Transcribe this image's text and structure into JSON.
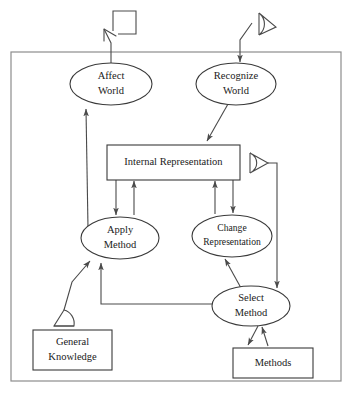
{
  "diagram": {
    "frame": {
      "label": "agent-boundary",
      "x": 11,
      "y": 52,
      "width": 330,
      "height": 329
    },
    "nodes": [
      {
        "id": "affect-world",
        "shape": "ellipse",
        "lines": [
          "Affect",
          "World"
        ],
        "cx": 111,
        "cy": 84,
        "rx": 41,
        "ry": 21
      },
      {
        "id": "recognize-world",
        "shape": "ellipse",
        "lines": [
          "Recognize",
          "World"
        ],
        "cx": 236,
        "cy": 84,
        "rx": 40,
        "ry": 21
      },
      {
        "id": "internal-representation",
        "shape": "rect",
        "lines": [
          "Internal Representation"
        ],
        "x": 107,
        "y": 145,
        "width": 133,
        "height": 35
      },
      {
        "id": "apply-method",
        "shape": "ellipse",
        "lines": [
          "Apply",
          "Method"
        ],
        "cx": 120,
        "cy": 238,
        "rx": 39,
        "ry": 21
      },
      {
        "id": "change-representation",
        "shape": "ellipse",
        "lines": [
          "Change",
          "Representation"
        ],
        "cx": 232,
        "cy": 236,
        "rx": 40,
        "ry": 21
      },
      {
        "id": "select-method",
        "shape": "ellipse",
        "lines": [
          "Select",
          "Method"
        ],
        "cx": 251,
        "cy": 306,
        "rx": 39,
        "ry": 20
      },
      {
        "id": "general-knowledge",
        "shape": "rect",
        "lines": [
          "General",
          "Knowledge"
        ],
        "x": 33,
        "y": 330,
        "width": 79,
        "height": 40
      },
      {
        "id": "methods",
        "shape": "rect",
        "lines": [
          "Methods"
        ],
        "x": 233,
        "y": 348,
        "width": 80,
        "height": 30
      }
    ],
    "sensors": [
      {
        "id": "effector-bracket",
        "kind": "bracket",
        "description": "open square bracket effector symbol"
      },
      {
        "id": "world-sensor-eye",
        "kind": "eye",
        "description": "lens sensor symbol observing the world"
      },
      {
        "id": "representation-sensor-eye",
        "kind": "eye",
        "description": "lens sensor reading internal representation"
      },
      {
        "id": "knowledge-sensor-eye",
        "kind": "eye",
        "description": "lens sensor reading general knowledge"
      }
    ],
    "edges": [
      {
        "id": "affect-world-to-effector",
        "from": "affect-world",
        "to": "effector-bracket"
      },
      {
        "id": "world-sensor-to-recognize-world",
        "from": "world-sensor-eye",
        "to": "recognize-world"
      },
      {
        "id": "recognize-world-to-internal-representation",
        "from": "recognize-world",
        "to": "internal-representation"
      },
      {
        "id": "internal-representation-to-apply-method",
        "from": "internal-representation",
        "to": "apply-method"
      },
      {
        "id": "apply-method-to-internal-representation",
        "from": "apply-method",
        "to": "internal-representation"
      },
      {
        "id": "internal-representation-to-change-representation",
        "from": "internal-representation",
        "to": "change-representation"
      },
      {
        "id": "change-representation-to-internal-representation",
        "from": "change-representation",
        "to": "internal-representation"
      },
      {
        "id": "apply-method-to-affect-world",
        "from": "apply-method",
        "to": "affect-world"
      },
      {
        "id": "representation-sensor-to-select-method",
        "from": "representation-sensor-eye",
        "to": "select-method"
      },
      {
        "id": "select-method-to-change-representation",
        "from": "select-method",
        "to": "change-representation"
      },
      {
        "id": "select-method-to-apply-method",
        "from": "select-method",
        "to": "apply-method"
      },
      {
        "id": "knowledge-sensor-to-apply-method",
        "from": "knowledge-sensor-eye",
        "to": "apply-method"
      },
      {
        "id": "select-method-to-methods",
        "from": "select-method",
        "to": "methods"
      },
      {
        "id": "methods-to-select-method",
        "from": "methods",
        "to": "select-method"
      }
    ]
  }
}
